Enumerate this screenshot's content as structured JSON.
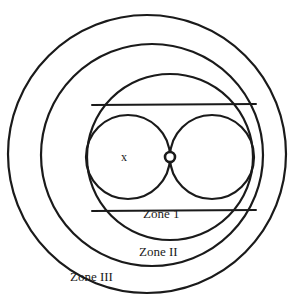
{
  "figure": {
    "background_color": "#ffffff",
    "stroke_color": "#1a1a1a",
    "width": 291,
    "height": 302
  },
  "labels": {
    "point_x": "x",
    "zone_1": "Zone 1",
    "zone_2": "Zone II",
    "zone_3": "Zone III"
  },
  "chart_data": {
    "type": "diagram",
    "background_color": "#ffffff",
    "stroke_color": "#1a1a1a",
    "canvas": {
      "width": 291,
      "height": 302
    },
    "shapes": [
      {
        "name": "zone-III-boundary-circle",
        "kind": "circle",
        "cx": 147,
        "cy": 154,
        "r": 139,
        "stroke_width": 2.2,
        "label": "Zone III"
      },
      {
        "name": "zone-II-boundary-circle",
        "kind": "circle",
        "cx": 152,
        "cy": 155,
        "r": 111,
        "stroke_width": 2.2,
        "label": "Zone II"
      },
      {
        "name": "zone-I-boundary-circle",
        "kind": "circle",
        "cx": 170,
        "cy": 157,
        "r": 83,
        "stroke_width": 2.2,
        "label": "Zone 1"
      },
      {
        "name": "left-lobe-circle",
        "kind": "circle",
        "cx": 128,
        "cy": 157,
        "r": 42,
        "stroke_width": 2.2,
        "label": "x"
      },
      {
        "name": "right-lobe-circle",
        "kind": "circle",
        "cx": 212,
        "cy": 157,
        "r": 42,
        "stroke_width": 2.2,
        "label": ""
      },
      {
        "name": "center-node",
        "kind": "circle",
        "cx": 170,
        "cy": 157,
        "r": 5,
        "stroke_width": 2.6,
        "fill": "#ffffff",
        "label": ""
      },
      {
        "name": "upper-chord-line",
        "kind": "line",
        "x1": 92,
        "y1": 105,
        "x2": 256,
        "y2": 104,
        "stroke_width": 2.0
      },
      {
        "name": "lower-chord-line",
        "kind": "line",
        "x1": 92,
        "y1": 211,
        "x2": 256,
        "y2": 210,
        "stroke_width": 2.0
      }
    ],
    "text_annotations": [
      {
        "name": "point-x-label",
        "text": "x",
        "x": 128,
        "y": 158
      },
      {
        "name": "zone-1-label",
        "text": "Zone 1",
        "x": 168,
        "y": 215
      },
      {
        "name": "zone-2-label",
        "text": "Zone II",
        "x": 163,
        "y": 253
      },
      {
        "name": "zone-3-label",
        "text": "Zone III",
        "x": 107,
        "y": 278
      }
    ]
  }
}
